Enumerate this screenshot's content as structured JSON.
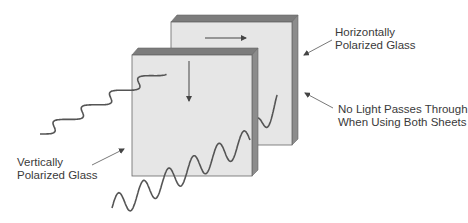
{
  "diagram": {
    "colors": {
      "glass_face": "#e6e6e6",
      "glass_top": "#7c7c7c",
      "glass_side": "#8c8c8c",
      "edge": "#666666",
      "wave": "#555555",
      "arrow": "#444444",
      "text": "#3a3a3a"
    },
    "elements": {
      "back_sheet": {
        "name": "Horizontally Polarized Glass",
        "polarization": "horizontal",
        "arrow_direction": "right"
      },
      "front_sheet": {
        "name": "Vertically Polarized Glass",
        "polarization": "vertical",
        "arrow_direction": "down"
      },
      "incident_wave": {
        "name": "unpolarized light wave",
        "orientation": "horizontal wiggle"
      },
      "transmitted_wave": {
        "name": "vertically polarized light wave",
        "orientation": "vertical wiggle"
      }
    },
    "labels": {
      "horizontal": {
        "line1": "Horizontally",
        "line2": "Polarized Glass"
      },
      "no_light": {
        "line1": "No Light Passes Through",
        "line2": "When Using Both Sheets"
      },
      "vertical": {
        "line1": "Vertically",
        "line2": "Polarized Glass"
      }
    }
  }
}
